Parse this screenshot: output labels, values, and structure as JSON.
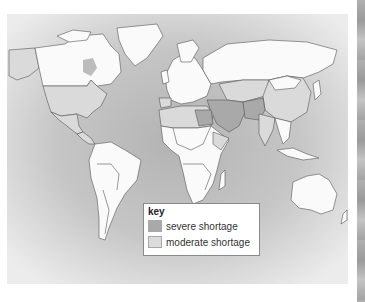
{
  "map": {
    "subject": "World map of water shortage",
    "colors": {
      "ocean_light": "#e6e6e6",
      "ocean_dark": "#b9b9b9",
      "no_shortage": "#fafafa",
      "moderate": "#d6d6d6",
      "severe": "#a9a9a9",
      "border": "#555555"
    }
  },
  "legend": {
    "title": "key",
    "items": [
      {
        "label": "severe shortage",
        "color": "#a9a9a9"
      },
      {
        "label": "moderate shortage",
        "color": "#dcdcdc"
      }
    ]
  }
}
